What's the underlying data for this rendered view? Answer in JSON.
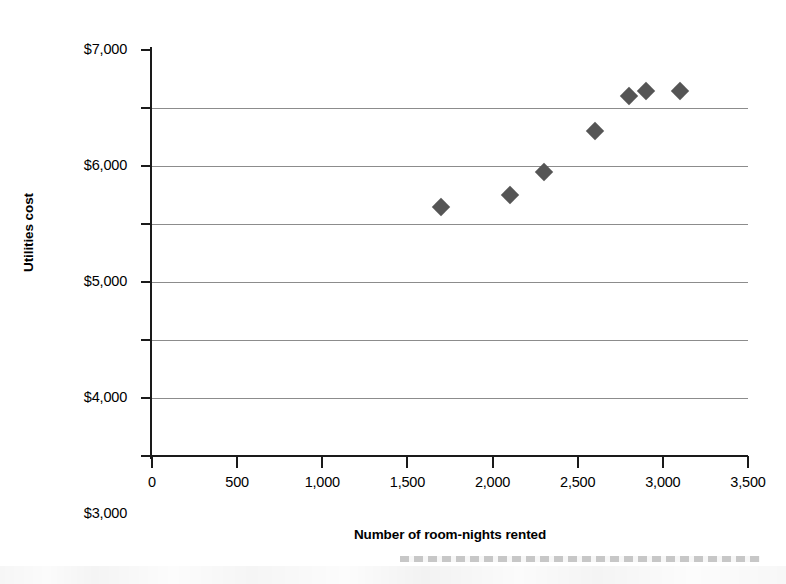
{
  "chart_data": {
    "type": "scatter",
    "title": "",
    "xlabel": "Number of room-nights rented",
    "ylabel": "Utilities cost",
    "xlim": [
      0,
      3500
    ],
    "ylim": [
      0,
      7000
    ],
    "xticks": [
      0,
      500,
      1000,
      1500,
      2000,
      2500,
      3000,
      3500
    ],
    "xtick_labels": [
      "0",
      "500",
      "1,000",
      "1,500",
      "2,000",
      "2,500",
      "3,000",
      "3,500"
    ],
    "yticks": [
      0,
      1000,
      2000,
      3000,
      4000,
      5000,
      6000,
      7000
    ],
    "ytick_labels": [
      "$0",
      "$1,000",
      "$2,000",
      "$3,000",
      "$4,000",
      "$5,000",
      "$6,000",
      "$7,000"
    ],
    "grid": "horizontal",
    "legend": "none",
    "marker": "diamond",
    "marker_color": "#555555",
    "gridline_color": "#8c8c8c",
    "axis_color": "#1a1a1a",
    "points": [
      {
        "x": 1700,
        "y": 4300
      },
      {
        "x": 2100,
        "y": 4500
      },
      {
        "x": 2300,
        "y": 4900
      },
      {
        "x": 2600,
        "y": 5600
      },
      {
        "x": 2800,
        "y": 6200
      },
      {
        "x": 2900,
        "y": 6300
      },
      {
        "x": 3100,
        "y": 6300
      }
    ]
  }
}
